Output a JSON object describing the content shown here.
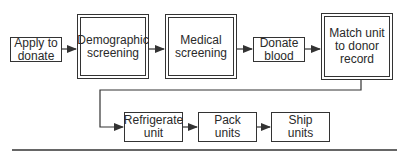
{
  "diagram": {
    "type": "flowchart",
    "nodes": [
      {
        "id": "apply",
        "label": "Apply to\ndonate",
        "style": "single"
      },
      {
        "id": "demographic",
        "label": "Demographic\nscreening",
        "style": "double"
      },
      {
        "id": "medical",
        "label": "Medical\nscreening",
        "style": "double"
      },
      {
        "id": "donate",
        "label": "Donate\nblood",
        "style": "single"
      },
      {
        "id": "match",
        "label": "Match unit\nto donor\nrecord",
        "style": "double"
      },
      {
        "id": "refrigerate",
        "label": "Refrigerate\nunit",
        "style": "single"
      },
      {
        "id": "pack",
        "label": "Pack\nunits",
        "style": "single"
      },
      {
        "id": "ship",
        "label": "Ship\nunits",
        "style": "single"
      }
    ],
    "edges": [
      {
        "from": "apply",
        "to": "demographic"
      },
      {
        "from": "demographic",
        "to": "medical"
      },
      {
        "from": "medical",
        "to": "donate"
      },
      {
        "from": "donate",
        "to": "match"
      },
      {
        "from": "match",
        "to": "refrigerate"
      },
      {
        "from": "refrigerate",
        "to": "pack"
      },
      {
        "from": "pack",
        "to": "ship"
      }
    ],
    "colors": {
      "line": "#333333",
      "background": "#ffffff"
    }
  }
}
